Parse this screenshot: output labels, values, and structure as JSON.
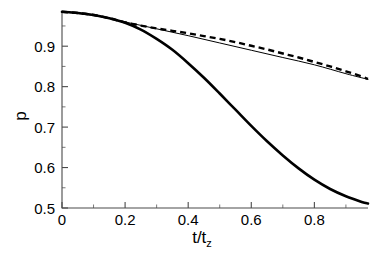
{
  "chart_data": {
    "type": "line",
    "title": "",
    "subtitle": "",
    "xlabel": "t/t",
    "xlabel_sub": "z",
    "ylabel": "p",
    "xlim": [
      0.0,
      0.97
    ],
    "ylim": [
      0.5,
      0.987
    ],
    "grid": false,
    "legend": "none",
    "x_ticks": [
      0,
      0.2,
      0.4,
      0.6,
      0.8
    ],
    "x_tick_labels": [
      "0",
      "0.2",
      "0.4",
      "0.6",
      "0.8"
    ],
    "x_minor_ticks": [
      0.1,
      0.3,
      0.5,
      0.7,
      0.9
    ],
    "y_ticks": [
      0.5,
      0.6,
      0.7,
      0.8,
      0.9
    ],
    "y_tick_labels": [
      "0.5",
      "0.6",
      "0.7",
      "0.8",
      "0.9"
    ],
    "y_minor_ticks": [
      0.55,
      0.65,
      0.75,
      0.85,
      0.95
    ],
    "series": [
      {
        "name": "thick-solid",
        "style": "solid-thick",
        "color": "#000000",
        "x": [
          0.0,
          0.05,
          0.1,
          0.15,
          0.2,
          0.25,
          0.3,
          0.35,
          0.4,
          0.45,
          0.5,
          0.55,
          0.6,
          0.65,
          0.7,
          0.75,
          0.8,
          0.85,
          0.9,
          0.95,
          0.97
        ],
        "values": [
          0.985,
          0.982,
          0.977,
          0.969,
          0.958,
          0.941,
          0.918,
          0.891,
          0.858,
          0.822,
          0.783,
          0.743,
          0.703,
          0.665,
          0.63,
          0.598,
          0.57,
          0.547,
          0.529,
          0.515,
          0.511
        ]
      },
      {
        "name": "thin-solid",
        "style": "solid-thin",
        "color": "#000000",
        "x": [
          0.0,
          0.1,
          0.2,
          0.3,
          0.4,
          0.5,
          0.6,
          0.7,
          0.8,
          0.9,
          0.97
        ],
        "values": [
          0.985,
          0.976,
          0.96,
          0.943,
          0.926,
          0.908,
          0.89,
          0.872,
          0.854,
          0.832,
          0.818
        ]
      },
      {
        "name": "dashed",
        "style": "dashed",
        "color": "#000000",
        "x": [
          0.0,
          0.05,
          0.1,
          0.15,
          0.2,
          0.25,
          0.3,
          0.35,
          0.4,
          0.45,
          0.5,
          0.55,
          0.6,
          0.65,
          0.7,
          0.75,
          0.8,
          0.85,
          0.9,
          0.95,
          0.97
        ],
        "values": [
          0.985,
          0.982,
          0.977,
          0.969,
          0.959,
          0.951,
          0.944,
          0.938,
          0.932,
          0.925,
          0.918,
          0.91,
          0.901,
          0.892,
          0.882,
          0.872,
          0.861,
          0.85,
          0.838,
          0.825,
          0.819
        ]
      }
    ]
  }
}
